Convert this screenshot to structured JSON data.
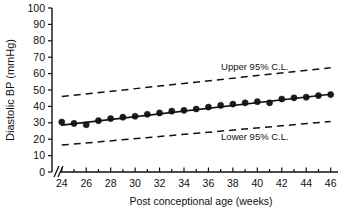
{
  "chart_data": {
    "type": "scatter",
    "title": "",
    "xlabel": "Post conceptional age (weeks)",
    "ylabel": "Diastolic BP (mmHg)",
    "xlim": [
      23.2,
      46.6
    ],
    "ylim": [
      0,
      100
    ],
    "grid": false,
    "axis_break_x": true,
    "legend_position": "inline-annotations",
    "xticks": [
      24,
      26,
      28,
      30,
      32,
      34,
      36,
      38,
      40,
      42,
      44,
      46
    ],
    "xticks_minor": [
      25,
      27,
      29,
      31,
      33,
      35,
      37,
      39,
      41,
      43,
      45
    ],
    "yticks": [
      0,
      10,
      20,
      30,
      40,
      50,
      60,
      70,
      80,
      90,
      100
    ],
    "xtick_labels": [
      "24",
      "26",
      "28",
      "30",
      "32",
      "34",
      "36",
      "38",
      "40",
      "42",
      "44",
      "46"
    ],
    "ytick_labels": [
      "0",
      "10",
      "20",
      "30",
      "40",
      "50",
      "60",
      "70",
      "80",
      "90",
      "100"
    ],
    "series": [
      {
        "name": "Mean diastolic BP",
        "type": "scatter",
        "marker": "filled-circle",
        "color": "#1c1c1c",
        "x": [
          24,
          25,
          26,
          27,
          28,
          29,
          30,
          31,
          32,
          33,
          34,
          35,
          36,
          37,
          38,
          39,
          40,
          41,
          42,
          43,
          44,
          45,
          46
        ],
        "y": [
          30.5,
          29.6,
          28.8,
          31.3,
          32.6,
          33.4,
          34.0,
          35.2,
          36.0,
          37.1,
          37.6,
          38.4,
          39.6,
          40.6,
          41.4,
          42.2,
          42.9,
          42.2,
          44.5,
          45.2,
          45.6,
          46.6,
          47.2
        ]
      },
      {
        "name": "Regression line",
        "type": "line",
        "style": "solid",
        "color": "#111111",
        "x": [
          24,
          46
        ],
        "y": [
          28.6,
          47.4
        ]
      },
      {
        "name": "Upper 95% C.L.",
        "type": "line",
        "style": "dashed",
        "color": "#111111",
        "x": [
          24,
          46
        ],
        "y": [
          46.0,
          63.6
        ]
      },
      {
        "name": "Lower 95% C.L.",
        "type": "line",
        "style": "dashed",
        "color": "#111111",
        "x": [
          24,
          46
        ],
        "y": [
          16.4,
          30.8
        ]
      }
    ],
    "annotations": [
      {
        "text": "Upper 95% C.L.",
        "x": 39.8,
        "y": 62.0
      },
      {
        "text": "Lower 95% C.L.",
        "x": 39.8,
        "y": 19.5
      }
    ]
  },
  "labels": {
    "y_axis_title": "Diastolic BP (mmHg)",
    "x_axis_title": "Post conceptional age (weeks)",
    "upper_cl": "Upper 95% C.L.",
    "lower_cl": "Lower 95% C.L."
  }
}
